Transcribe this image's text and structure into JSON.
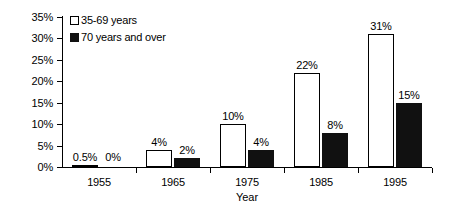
{
  "chart_data": {
    "type": "bar",
    "title": "",
    "xlabel": "Year",
    "ylabel": "",
    "categories": [
      "1955",
      "1965",
      "1975",
      "1985",
      "1995"
    ],
    "series": [
      {
        "name": "35-69 years",
        "color": "#ffffff",
        "border_color": "#000000",
        "values": [
          0.5,
          4,
          10,
          22,
          31
        ],
        "labels": [
          "0.5%",
          "4%",
          "10%",
          "22%",
          "31%"
        ]
      },
      {
        "name": "70 years and over",
        "color": "#111111",
        "border_color": "#111111",
        "values": [
          0,
          2,
          4,
          8,
          15
        ],
        "labels": [
          "0%",
          "2%",
          "4%",
          "8%",
          "15%"
        ]
      }
    ],
    "ylim": [
      0,
      35
    ],
    "yticks": [
      0,
      5,
      10,
      15,
      20,
      25,
      30,
      35
    ],
    "ytick_labels": [
      "0%",
      "5%",
      "10%",
      "15%",
      "20%",
      "25%",
      "30%",
      "35%"
    ],
    "grid": false,
    "legend_position": "top-left"
  }
}
